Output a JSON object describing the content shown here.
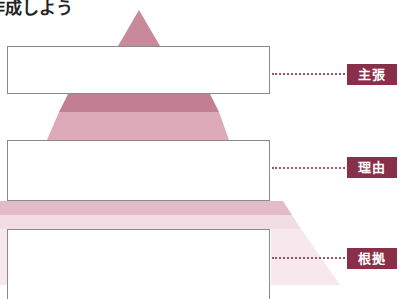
{
  "title": "作成しよう",
  "colors": {
    "tag_bg": "#8a2f4a",
    "tag_text": "#ffffff",
    "apex": "#c88a9b",
    "band_dark": "#c27f92",
    "band_mid": "#dcaab8",
    "band_light": "#ecd0d8",
    "band_faint": "#f6e8ec",
    "box_border": "#8a8a8a",
    "leader": "#a0506a"
  },
  "levels": [
    {
      "id": "claim",
      "label": "主張",
      "box_text": ""
    },
    {
      "id": "reason",
      "label": "理由",
      "box_text": ""
    },
    {
      "id": "evidence",
      "label": "根拠",
      "box_text": ""
    }
  ]
}
